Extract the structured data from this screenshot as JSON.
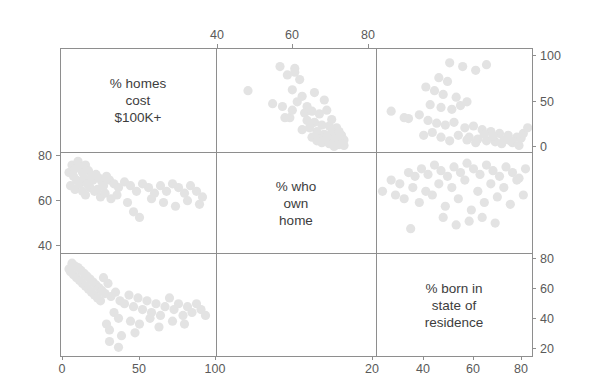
{
  "figure": {
    "type": "scatterplot-matrix",
    "variables": [
      "% homes cost $100K+",
      "% who own home",
      "% born in state of residence"
    ],
    "diagonal_labels": [
      {
        "lines": [
          "% homes",
          "cost",
          "$100K+"
        ],
        "cell": "row1-col1"
      },
      {
        "lines": [
          "% who",
          "own",
          "home"
        ],
        "cell": "row2-col2"
      },
      {
        "lines": [
          "% born in",
          "state of",
          "residence"
        ],
        "cell": "row3-col3"
      }
    ],
    "panel": {
      "left": 60,
      "top": 48,
      "right": 532,
      "bottom": 356
    },
    "dividers": {
      "vertical": [
        216,
        376
      ],
      "horizontal": [
        152,
        253
      ]
    },
    "point_color": "#e3e3e3",
    "frame_color": "#8e8e8e",
    "point_radius": 4.6
  },
  "axes": {
    "top": {
      "label_values": [
        "40",
        "60",
        "80"
      ],
      "tick_x": [
        217,
        292,
        368
      ],
      "belongs_to": "% who own home",
      "range": [
        27,
        92
      ]
    },
    "bottom_left": {
      "label_values": [
        "0",
        "50",
        "100"
      ],
      "tick_x": [
        62,
        139,
        215
      ],
      "belongs_to": "% homes cost $100K+",
      "range": [
        -3,
        101
      ]
    },
    "bottom_right": {
      "label_values": [
        "20",
        "40",
        "60",
        "80"
      ],
      "tick_x": [
        372,
        423,
        473,
        521
      ],
      "belongs_to": "% born in state of residence",
      "range": [
        13,
        85
      ]
    },
    "left": {
      "label_values": [
        "80",
        "60",
        "40"
      ],
      "tick_y": [
        155,
        200,
        245
      ],
      "belongs_to": "% who own home",
      "range": [
        33,
        87
      ]
    },
    "right_upper": {
      "label_values": [
        "100",
        "50",
        "0"
      ],
      "tick_y": [
        55,
        101,
        146
      ],
      "belongs_to": "% homes cost $100K+",
      "range": [
        -4,
        108
      ]
    },
    "right_lower": {
      "label_values": [
        "80",
        "60",
        "40",
        "20"
      ],
      "tick_y": [
        258,
        288,
        318,
        348
      ],
      "belongs_to": "% born in state of residence",
      "range": [
        16,
        87
      ]
    }
  },
  "chart_data": {
    "type": "scatter",
    "title": "",
    "xlabel": "",
    "ylabel": "",
    "grid": false,
    "legend": "none",
    "variables": [
      "% homes cost $100K+",
      "% who own home",
      "% born in state of residence"
    ],
    "panels": [
      {
        "id": "r1c2",
        "row": 1,
        "col": 2,
        "x_var": "% who own home",
        "y_var": "% homes cost $100K+",
        "xlim": [
          27,
          92
        ],
        "ylim": [
          -4,
          108
        ],
        "points": [
          [
            53,
            88
          ],
          [
            56,
            79
          ],
          [
            59,
            86
          ],
          [
            59,
            82
          ],
          [
            50,
            48
          ],
          [
            61,
            74
          ],
          [
            58,
            63
          ],
          [
            62,
            56
          ],
          [
            54,
            45
          ],
          [
            64,
            45
          ],
          [
            63,
            38
          ],
          [
            55,
            33
          ],
          [
            57,
            33
          ],
          [
            66,
            40
          ],
          [
            69,
            37
          ],
          [
            72,
            41
          ],
          [
            67,
            28
          ],
          [
            70,
            25
          ],
          [
            73,
            24
          ],
          [
            68,
            18
          ],
          [
            71,
            15
          ],
          [
            74,
            17
          ],
          [
            66,
            12
          ],
          [
            69,
            10
          ],
          [
            72,
            9
          ],
          [
            75,
            12
          ],
          [
            70,
            6
          ],
          [
            73,
            5
          ],
          [
            76,
            8
          ],
          [
            78,
            14
          ],
          [
            77,
            4
          ],
          [
            79,
            9
          ],
          [
            40,
            62
          ],
          [
            67,
            60
          ],
          [
            71,
            52
          ],
          [
            74,
            31
          ],
          [
            76,
            22
          ],
          [
            78,
            5
          ],
          [
            65,
            22
          ],
          [
            62,
            20
          ],
          [
            75,
            2
          ],
          [
            77,
            18
          ],
          [
            79,
            3
          ],
          [
            72,
            12
          ],
          [
            68,
            8
          ],
          [
            64,
            30
          ],
          [
            60,
            50
          ],
          [
            58,
            41
          ]
        ]
      },
      {
        "id": "r1c3",
        "row": 1,
        "col": 3,
        "x_var": "% born in state of residence",
        "y_var": "% homes cost $100K+",
        "xlim": [
          13,
          85
        ],
        "ylim": [
          -4,
          108
        ],
        "points": [
          [
            47,
            92
          ],
          [
            53,
            88
          ],
          [
            59,
            84
          ],
          [
            64,
            90
          ],
          [
            42,
            76
          ],
          [
            46,
            72
          ],
          [
            36,
            66
          ],
          [
            40,
            62
          ],
          [
            44,
            58
          ],
          [
            50,
            55
          ],
          [
            55,
            50
          ],
          [
            38,
            47
          ],
          [
            43,
            44
          ],
          [
            48,
            42
          ],
          [
            52,
            46
          ],
          [
            20,
            40
          ],
          [
            26,
            33
          ],
          [
            28,
            32
          ],
          [
            33,
            36
          ],
          [
            37,
            30
          ],
          [
            41,
            27
          ],
          [
            45,
            25
          ],
          [
            49,
            28
          ],
          [
            54,
            22
          ],
          [
            58,
            24
          ],
          [
            62,
            20
          ],
          [
            66,
            18
          ],
          [
            70,
            16
          ],
          [
            74,
            14
          ],
          [
            78,
            12
          ],
          [
            56,
            12
          ],
          [
            60,
            10
          ],
          [
            64,
            8
          ],
          [
            68,
            7
          ],
          [
            72,
            9
          ],
          [
            76,
            6
          ],
          [
            80,
            11
          ],
          [
            67,
            13
          ],
          [
            71,
            5
          ],
          [
            75,
            8
          ],
          [
            63,
            15
          ],
          [
            59,
            6
          ],
          [
            55,
            9
          ],
          [
            51,
            14
          ],
          [
            47,
            8
          ],
          [
            43,
            12
          ],
          [
            39,
            17
          ],
          [
            35,
            14
          ],
          [
            79,
            3
          ],
          [
            81,
            16
          ],
          [
            83,
            22
          ]
        ]
      },
      {
        "id": "r2c1",
        "row": 2,
        "col": 1,
        "x_var": "% homes cost $100K+",
        "y_var": "% who own home",
        "xlim": [
          -3,
          101
        ],
        "ylim": [
          33,
          87
        ],
        "points": [
          [
            3,
            76
          ],
          [
            5,
            80
          ],
          [
            7,
            78
          ],
          [
            9,
            82
          ],
          [
            11,
            79
          ],
          [
            6,
            74
          ],
          [
            8,
            72
          ],
          [
            12,
            76
          ],
          [
            14,
            80
          ],
          [
            10,
            70
          ],
          [
            13,
            73
          ],
          [
            16,
            77
          ],
          [
            18,
            74
          ],
          [
            4,
            69
          ],
          [
            7,
            67
          ],
          [
            15,
            70
          ],
          [
            19,
            72
          ],
          [
            21,
            75
          ],
          [
            23,
            73
          ],
          [
            17,
            68
          ],
          [
            20,
            66
          ],
          [
            25,
            71
          ],
          [
            28,
            74
          ],
          [
            12,
            66
          ],
          [
            14,
            64
          ],
          [
            22,
            67
          ],
          [
            26,
            69
          ],
          [
            30,
            72
          ],
          [
            33,
            70
          ],
          [
            24,
            63
          ],
          [
            27,
            65
          ],
          [
            36,
            68
          ],
          [
            40,
            71
          ],
          [
            44,
            69
          ],
          [
            48,
            66
          ],
          [
            52,
            70
          ],
          [
            56,
            68
          ],
          [
            60,
            65
          ],
          [
            64,
            69
          ],
          [
            68,
            66
          ],
          [
            72,
            70
          ],
          [
            76,
            68
          ],
          [
            80,
            65
          ],
          [
            84,
            69
          ],
          [
            88,
            66
          ],
          [
            92,
            63
          ],
          [
            31,
            62
          ],
          [
            35,
            64
          ],
          [
            42,
            60
          ],
          [
            58,
            62
          ],
          [
            66,
            60
          ],
          [
            74,
            58
          ],
          [
            82,
            61
          ],
          [
            90,
            59
          ],
          [
            50,
            52
          ],
          [
            46,
            55
          ]
        ]
      },
      {
        "id": "r2c3",
        "row": 2,
        "col": 3,
        "x_var": "% born in state of residence",
        "y_var": "% who own home",
        "xlim": [
          13,
          85
        ],
        "ylim": [
          33,
          87
        ],
        "points": [
          [
            20,
            72
          ],
          [
            24,
            70
          ],
          [
            28,
            76
          ],
          [
            31,
            74
          ],
          [
            34,
            78
          ],
          [
            37,
            75
          ],
          [
            40,
            80
          ],
          [
            43,
            77
          ],
          [
            46,
            74
          ],
          [
            49,
            79
          ],
          [
            52,
            76
          ],
          [
            55,
            81
          ],
          [
            58,
            78
          ],
          [
            61,
            75
          ],
          [
            64,
            80
          ],
          [
            67,
            77
          ],
          [
            70,
            74
          ],
          [
            73,
            79
          ],
          [
            76,
            76
          ],
          [
            79,
            73
          ],
          [
            82,
            78
          ],
          [
            30,
            68
          ],
          [
            36,
            66
          ],
          [
            42,
            70
          ],
          [
            48,
            68
          ],
          [
            54,
            72
          ],
          [
            60,
            66
          ],
          [
            66,
            70
          ],
          [
            72,
            68
          ],
          [
            78,
            72
          ],
          [
            16,
            66
          ],
          [
            22,
            64
          ],
          [
            26,
            62
          ],
          [
            33,
            60
          ],
          [
            39,
            64
          ],
          [
            45,
            58
          ],
          [
            51,
            62
          ],
          [
            57,
            56
          ],
          [
            63,
            60
          ],
          [
            69,
            63
          ],
          [
            75,
            59
          ],
          [
            81,
            64
          ],
          [
            44,
            52
          ],
          [
            50,
            48
          ],
          [
            56,
            50
          ],
          [
            62,
            52
          ],
          [
            68,
            49
          ],
          [
            29,
            46
          ]
        ]
      },
      {
        "id": "r3c1",
        "row": 3,
        "col": 1,
        "x_var": "% homes cost $100K+",
        "y_var": "% born in state of residence",
        "xlim": [
          -3,
          101
        ],
        "ylim": [
          16,
          87
        ],
        "points": [
          [
            3,
            76
          ],
          [
            5,
            80
          ],
          [
            7,
            78
          ],
          [
            4,
            74
          ],
          [
            6,
            72
          ],
          [
            9,
            77
          ],
          [
            11,
            75
          ],
          [
            8,
            70
          ],
          [
            10,
            68
          ],
          [
            13,
            73
          ],
          [
            15,
            71
          ],
          [
            12,
            66
          ],
          [
            14,
            64
          ],
          [
            17,
            69
          ],
          [
            19,
            67
          ],
          [
            16,
            62
          ],
          [
            18,
            60
          ],
          [
            21,
            65
          ],
          [
            23,
            63
          ],
          [
            20,
            58
          ],
          [
            22,
            56
          ],
          [
            25,
            61
          ],
          [
            27,
            59
          ],
          [
            24,
            54
          ],
          [
            26,
            70
          ],
          [
            29,
            66
          ],
          [
            31,
            57
          ],
          [
            34,
            60
          ],
          [
            37,
            54
          ],
          [
            40,
            52
          ],
          [
            43,
            58
          ],
          [
            46,
            50
          ],
          [
            49,
            56
          ],
          [
            52,
            48
          ],
          [
            55,
            54
          ],
          [
            58,
            46
          ],
          [
            61,
            52
          ],
          [
            64,
            44
          ],
          [
            67,
            50
          ],
          [
            70,
            56
          ],
          [
            73,
            48
          ],
          [
            76,
            52
          ],
          [
            79,
            44
          ],
          [
            82,
            50
          ],
          [
            85,
            46
          ],
          [
            88,
            52
          ],
          [
            91,
            48
          ],
          [
            94,
            44
          ],
          [
            33,
            46
          ],
          [
            36,
            42
          ],
          [
            44,
            40
          ],
          [
            50,
            38
          ],
          [
            57,
            42
          ],
          [
            63,
            36
          ],
          [
            72,
            40
          ],
          [
            80,
            38
          ],
          [
            30,
            34
          ],
          [
            38,
            30
          ],
          [
            47,
            32
          ],
          [
            30,
            26
          ],
          [
            36,
            22
          ],
          [
            28,
            38
          ]
        ]
      }
    ]
  }
}
